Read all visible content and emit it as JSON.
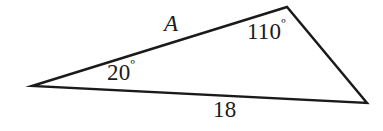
{
  "figure": {
    "type": "triangle-diagram",
    "background_color": "#ffffff",
    "stroke_color": "#1a1a1a",
    "width": 383,
    "height": 131
  },
  "triangle": {
    "vertices": {
      "left": {
        "x": 32,
        "y": 86
      },
      "apex": {
        "x": 287,
        "y": 7
      },
      "right": {
        "x": 367,
        "y": 103
      }
    },
    "points_attr": "32,86 287,7 367,103"
  },
  "labels": {
    "side_a": {
      "text": "A",
      "meaning": "unknown-side-length",
      "edge": "left-vertex-to-apex"
    },
    "angle_apex": {
      "value": "110",
      "degree_symbol": "º",
      "meaning": "interior-angle-at-apex"
    },
    "angle_left": {
      "value": "20",
      "degree_symbol": "º",
      "meaning": "interior-angle-at-left-vertex"
    },
    "side_base": {
      "text": "18",
      "meaning": "known-side-length",
      "edge": "left-vertex-to-right-vertex"
    }
  }
}
